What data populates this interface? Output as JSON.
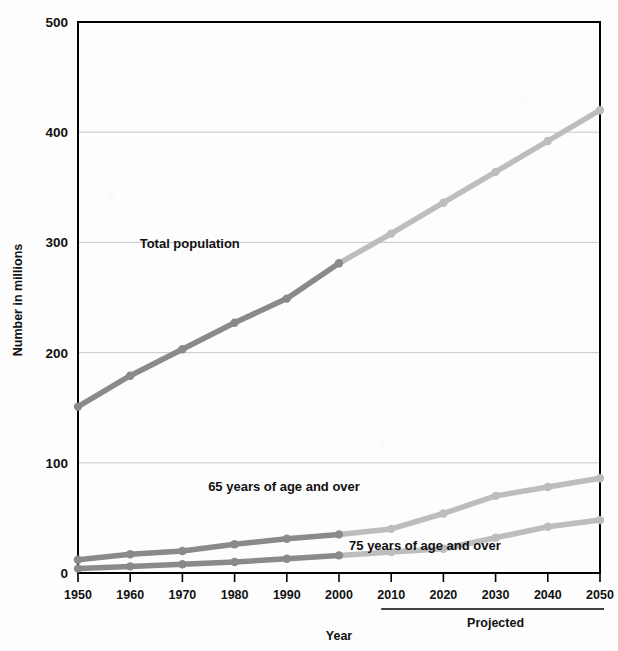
{
  "chart_data": {
    "type": "line",
    "title": "",
    "xlabel": "Year",
    "ylabel": "Number in millions",
    "x": [
      1950,
      1960,
      1970,
      1980,
      1990,
      2000,
      2010,
      2020,
      2030,
      2040,
      2050
    ],
    "xtick_labels": [
      "1950",
      "1960",
      "1970",
      "1980",
      "1990",
      "2000",
      "2010",
      "2020",
      "2030",
      "2040",
      "2050"
    ],
    "ytick_labels": [
      "0",
      "100",
      "200",
      "300",
      "400",
      "500"
    ],
    "ytick_values": [
      0,
      100,
      200,
      300,
      400,
      500
    ],
    "ylim": [
      0,
      500
    ],
    "xlim": [
      1950,
      2050
    ],
    "grid": "horizontal",
    "legend": "inline-annotations",
    "series": [
      {
        "name": "Total population",
        "values": [
          151,
          179,
          203,
          227,
          249,
          281,
          308,
          336,
          364,
          392,
          420
        ],
        "historical_through": 2000
      },
      {
        "name": "65 years of age and over",
        "values": [
          12,
          17,
          20,
          26,
          31,
          35,
          40,
          54,
          70,
          78,
          86
        ],
        "historical_through": 2000
      },
      {
        "name": "75 years of age and over",
        "values": [
          4,
          6,
          8,
          10,
          13,
          16,
          19,
          22,
          32,
          42,
          48
        ],
        "historical_through": 2000
      }
    ],
    "annotations": [
      {
        "text": "Total population",
        "x": 1981,
        "y": 295
      },
      {
        "text": "65 years of age and over",
        "x": 2004,
        "y": 74
      },
      {
        "text": "75 years of age and over",
        "x": 2031,
        "y": 21
      },
      {
        "text": "Projected",
        "x": 2030,
        "y": -62
      }
    ],
    "projected_bracket": {
      "label": "Projected",
      "from": 2010,
      "to": 2050
    },
    "colors": {
      "historical": "#8a8a8a",
      "projected": "#bdbdbd",
      "gridline": "#c9c9c9",
      "axis": "#000000",
      "text": "#111111",
      "background": "#fdfdfd"
    }
  }
}
